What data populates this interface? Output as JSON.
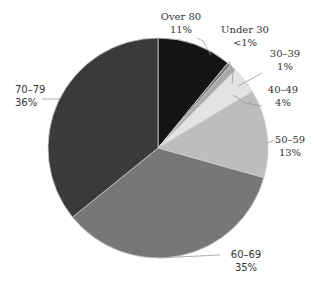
{
  "chart_data": {
    "type": "pie",
    "title": "",
    "categories": [
      "Under 30",
      "30–39",
      "40–49",
      "50–59",
      "60–69",
      "70–79",
      "Over 80"
    ],
    "values": [
      0.5,
      1,
      4,
      13,
      35,
      36,
      11
    ],
    "value_labels": [
      "<1%",
      "1%",
      "4%",
      "13%",
      "35%",
      "36%",
      "11%"
    ],
    "colors": [
      "#7a7a7a",
      "#a8a8a8",
      "#e3e3e3",
      "#bdbdbd",
      "#777777",
      "#3a3a3a",
      "#141414"
    ],
    "legend": "none (data labels with leader lines)"
  },
  "labels": {
    "under30": {
      "name": "Under 30",
      "pct": "<1%"
    },
    "a30": {
      "name": "30–39",
      "pct": "1%"
    },
    "a40": {
      "name": "40–49",
      "pct": "4%"
    },
    "a50": {
      "name": "50–59",
      "pct": "13%"
    },
    "a60": {
      "name": "60–69",
      "pct": "35%"
    },
    "a70": {
      "name": "70–79",
      "pct": "36%"
    },
    "over80": {
      "name": "Over 80",
      "pct": "11%"
    }
  }
}
